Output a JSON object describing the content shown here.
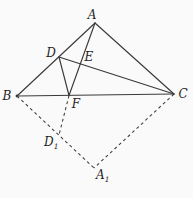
{
  "page": {
    "background": "#fafafa",
    "width": 193,
    "height": 198
  },
  "diagram": {
    "type": "geometry-figure",
    "stroke_color": "#3a3a3a",
    "label_color": "#1f1f1f",
    "solid_stroke_width": 1.15,
    "dashed_stroke_width": 1.05,
    "dash_pattern": "3 3",
    "points": {
      "A": {
        "x": 95,
        "y": 23
      },
      "B": {
        "x": 17,
        "y": 96
      },
      "C": {
        "x": 174,
        "y": 94
      },
      "D": {
        "x": 59,
        "y": 57
      },
      "E": {
        "x": 80,
        "y": 64
      },
      "F": {
        "x": 69,
        "y": 95.5
      },
      "D1": {
        "x": 59,
        "y": 135
      },
      "A1": {
        "x": 94,
        "y": 168
      }
    },
    "solid_segments": [
      {
        "from": "A",
        "to": "B"
      },
      {
        "from": "B",
        "to": "C"
      },
      {
        "from": "C",
        "to": "A"
      },
      {
        "from": "A",
        "to": "F"
      },
      {
        "from": "D",
        "to": "C"
      },
      {
        "from": "D",
        "to": "F"
      }
    ],
    "dashed_segments": [
      {
        "from": "B",
        "to": "A1"
      },
      {
        "from": "F",
        "to": "D1"
      },
      {
        "from": "C",
        "to": "A1"
      }
    ],
    "vertex_dots": [
      {
        "point": "B",
        "r": 1.4
      }
    ],
    "labels": [
      {
        "name": "label-A",
        "text": "A",
        "sub": "",
        "x": 92,
        "y": 19,
        "anchor": "middle"
      },
      {
        "name": "label-B",
        "text": "B",
        "sub": "",
        "x": 7,
        "y": 100,
        "anchor": "middle"
      },
      {
        "name": "label-C",
        "text": "C",
        "sub": "",
        "x": 183,
        "y": 98,
        "anchor": "middle"
      },
      {
        "name": "label-D",
        "text": "D",
        "sub": "",
        "x": 51,
        "y": 57,
        "anchor": "middle"
      },
      {
        "name": "label-E",
        "text": "E",
        "sub": "",
        "x": 89,
        "y": 61,
        "anchor": "middle"
      },
      {
        "name": "label-F",
        "text": "F",
        "sub": "",
        "x": 76,
        "y": 108,
        "anchor": "middle"
      },
      {
        "name": "label-D1",
        "text": "D",
        "sub": "1",
        "x": 44,
        "y": 146,
        "anchor": "start"
      },
      {
        "name": "label-A1",
        "text": "A",
        "sub": "1",
        "x": 96,
        "y": 179,
        "anchor": "start"
      }
    ]
  }
}
